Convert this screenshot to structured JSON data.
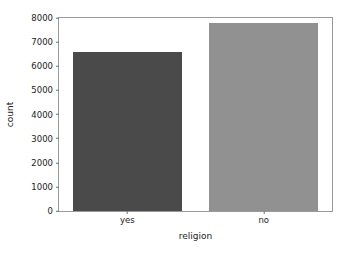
{
  "chart_data": {
    "type": "bar",
    "title": "",
    "xlabel": "religion",
    "ylabel": "count",
    "categories": [
      "yes",
      "no"
    ],
    "values": [
      6600,
      7800
    ],
    "bar_colors": [
      "#4a4a4a",
      "#919191"
    ],
    "ylim": [
      0,
      8000
    ],
    "yticks": [
      0,
      1000,
      2000,
      3000,
      4000,
      5000,
      6000,
      7000,
      8000
    ],
    "ytick_labels": [
      "0",
      "1000",
      "2000",
      "3000",
      "4000",
      "5000",
      "6000",
      "7000",
      "8000"
    ],
    "grid": false,
    "legend": null,
    "background_color": "#ffffff",
    "frame_color": "#9a9a9a"
  }
}
